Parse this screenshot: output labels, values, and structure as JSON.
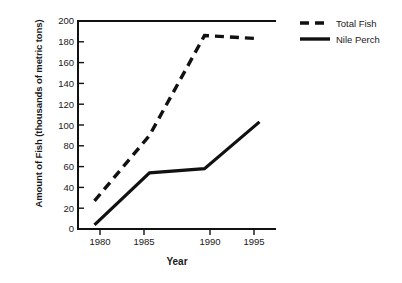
{
  "chart_data": {
    "type": "line",
    "title": "",
    "xlabel": "Year",
    "ylabel": "Amount of Fish (thousands of metric tons)",
    "x": [
      1980,
      1985,
      1990,
      1995
    ],
    "xtick_labels": [
      "1980",
      "1985",
      "1990",
      "1995"
    ],
    "ytick_labels": [
      "0",
      "20",
      "40",
      "60",
      "80",
      "100",
      "120",
      "140",
      "160",
      "180",
      "200"
    ],
    "ytick_values": [
      0,
      20,
      40,
      60,
      80,
      100,
      120,
      140,
      160,
      180,
      200
    ],
    "xlim": [
      1978.5,
      1996.5
    ],
    "ylim": [
      0,
      200
    ],
    "grid": false,
    "legend_position": "right",
    "series": [
      {
        "name": "Total Fish",
        "style": "dashed",
        "color": "#111111",
        "values": [
          27,
          90,
          186,
          183
        ]
      },
      {
        "name": "Nile Perch",
        "style": "solid",
        "color": "#111111",
        "values": [
          4,
          54,
          58,
          103
        ]
      }
    ]
  },
  "axes": {
    "y_title": "Amount of Fish (thousands of metric tons)",
    "x_title": "Year"
  },
  "legend": {
    "items": [
      {
        "label": "Total Fish",
        "style": "dashed"
      },
      {
        "label": "Nile Perch",
        "style": "solid"
      }
    ]
  },
  "ticks": {
    "y": [
      "200",
      "180",
      "160",
      "140",
      "120",
      "100",
      "80",
      "60",
      "40",
      "20",
      "0"
    ],
    "x": [
      "1980",
      "1985",
      "1990",
      "1995"
    ]
  }
}
